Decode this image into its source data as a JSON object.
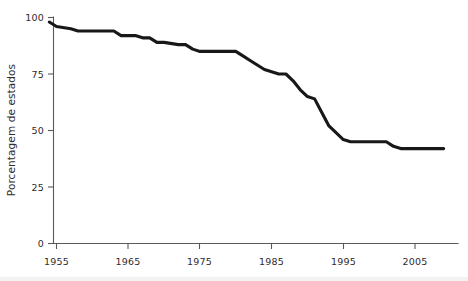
{
  "chart_data": {
    "type": "line",
    "title": "",
    "subtitle": "",
    "xlabel": "",
    "ylabel": "Porcentagem de estados",
    "xlim": [
      1954,
      2010
    ],
    "ylim": [
      0,
      100
    ],
    "grid": false,
    "legend": null,
    "x_ticks": [
      1955,
      1965,
      1975,
      1985,
      1995,
      2005
    ],
    "x_tick_labels": [
      "1955",
      "1965",
      "1975",
      "1985",
      "1995",
      "2005"
    ],
    "y_ticks": [
      0,
      25,
      50,
      75,
      100
    ],
    "y_tick_labels": [
      "0",
      "25",
      "50",
      "75",
      "100"
    ],
    "series": [
      {
        "name": "Porcentagem de estados",
        "color": "#1a1718",
        "x": [
          1954,
          1955,
          1957,
          1958,
          1963,
          1964,
          1966,
          1967,
          1968,
          1969,
          1970,
          1972,
          1973,
          1974,
          1975,
          1980,
          1981,
          1982,
          1983,
          1984,
          1986,
          1987,
          1988,
          1989,
          1990,
          1991,
          1992,
          1993,
          1995,
          1996,
          2000,
          2001,
          2002,
          2003,
          2009
        ],
        "y": [
          98,
          96,
          95,
          94,
          94,
          92,
          92,
          91,
          91,
          89,
          89,
          88,
          88,
          86,
          85,
          85,
          83,
          81,
          79,
          77,
          75,
          75,
          72,
          68,
          65,
          64,
          58,
          52,
          46,
          45,
          45,
          45,
          43,
          42,
          42
        ]
      }
    ],
    "annotations": []
  },
  "figure": {
    "axis_color": "#58595b",
    "line_color": "#1a1718",
    "background": "#ffffff"
  }
}
